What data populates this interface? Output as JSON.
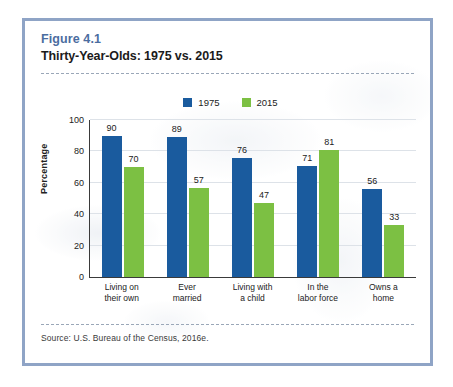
{
  "figure": {
    "number": "Figure 4.1",
    "title": "Thirty-Year-Olds: 1975 vs. 2015",
    "source": "Source: U.S. Bureau of the Census, 2016e."
  },
  "colors": {
    "series_1975": "#1a5b9e",
    "series_2015": "#7cc043",
    "frame": "#8fa4c6",
    "figure_number_text": "#4b6da0",
    "axis": "#3a3a3a",
    "gridline": "#dde2e8"
  },
  "chart_data": {
    "type": "bar",
    "title": "Thirty-Year-Olds: 1975 vs. 2015",
    "xlabel": "",
    "ylabel": "Percentage",
    "ylim": [
      0,
      100
    ],
    "yticks": [
      0,
      20,
      40,
      60,
      80,
      100
    ],
    "grid": true,
    "legend_position": "top-center",
    "categories": [
      "Living on their own",
      "Ever married",
      "Living with a child",
      "In the labor force",
      "Owns a home"
    ],
    "category_lines": [
      [
        "Living on",
        "their own"
      ],
      [
        "Ever",
        "married"
      ],
      [
        "Living with",
        "a child"
      ],
      [
        "In the",
        "labor force"
      ],
      [
        "Owns a",
        "home"
      ]
    ],
    "series": [
      {
        "name": "1975",
        "color": "#1a5b9e",
        "values": [
          90,
          89,
          76,
          71,
          56
        ]
      },
      {
        "name": "2015",
        "color": "#7cc043",
        "values": [
          70,
          57,
          47,
          81,
          33
        ]
      }
    ]
  }
}
